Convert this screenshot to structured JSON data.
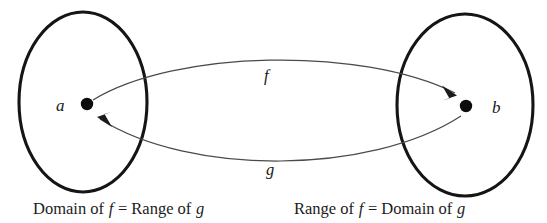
{
  "diagram": {
    "background_color": "#ffffff",
    "outline_color": "#151515",
    "arrow_color": "#4a4a4a",
    "left_set": {
      "element_label": "a",
      "caption_prefix": "Domain of ",
      "caption_var1": "f",
      "caption_middle": " = Range of ",
      "caption_var2": "g"
    },
    "right_set": {
      "element_label": "b",
      "caption_prefix": "Range of ",
      "caption_var1": "f",
      "caption_middle": " = Domain of ",
      "caption_var2": "g"
    },
    "forward_map": {
      "label": "f",
      "direction": "left-to-right"
    },
    "inverse_map": {
      "label": "g",
      "direction": "right-to-left"
    }
  }
}
